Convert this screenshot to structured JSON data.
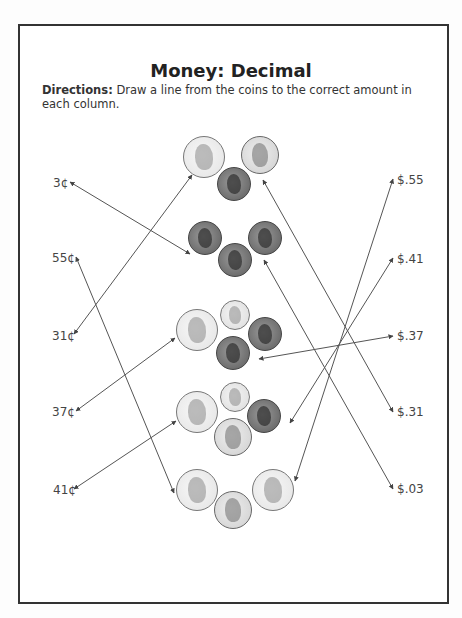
{
  "worksheet": {
    "title": "Money: Decimal",
    "directions_label": "Directions:",
    "directions_text": " Draw a line from the coins to the correct amount in each column."
  },
  "left_column": [
    {
      "label": "3¢",
      "x": 53,
      "y": 176
    },
    {
      "label": "55¢",
      "x": 52,
      "y": 251
    },
    {
      "label": "31¢",
      "x": 52,
      "y": 329
    },
    {
      "label": "37¢",
      "x": 52,
      "y": 405
    },
    {
      "label": "41¢",
      "x": 53,
      "y": 483
    }
  ],
  "right_column": [
    {
      "label": "$.55",
      "x": 397,
      "y": 173
    },
    {
      "label": "$.41",
      "x": 397,
      "y": 252
    },
    {
      "label": "$.37",
      "x": 397,
      "y": 329
    },
    {
      "label": "$.31",
      "x": 397,
      "y": 405
    },
    {
      "label": "$.03",
      "x": 397,
      "y": 482
    }
  ],
  "coin_groups": [
    {
      "name": "group-31-cents",
      "coins": [
        {
          "type": "quarter",
          "cx": 204,
          "cy": 157,
          "r": 21
        },
        {
          "type": "nickel",
          "cx": 260,
          "cy": 155,
          "r": 19
        },
        {
          "type": "penny",
          "cx": 234,
          "cy": 184,
          "r": 17
        }
      ]
    },
    {
      "name": "group-3-cents",
      "coins": [
        {
          "type": "penny",
          "cx": 205,
          "cy": 238,
          "r": 17
        },
        {
          "type": "penny",
          "cx": 265,
          "cy": 238,
          "r": 17
        },
        {
          "type": "penny",
          "cx": 235,
          "cy": 260,
          "r": 17
        }
      ]
    },
    {
      "name": "group-37-cents",
      "coins": [
        {
          "type": "quarter",
          "cx": 197,
          "cy": 330,
          "r": 21
        },
        {
          "type": "dime",
          "cx": 235,
          "cy": 315,
          "r": 15
        },
        {
          "type": "penny",
          "cx": 265,
          "cy": 334,
          "r": 17
        },
        {
          "type": "penny",
          "cx": 233,
          "cy": 353,
          "r": 17
        }
      ]
    },
    {
      "name": "group-41-cents",
      "coins": [
        {
          "type": "quarter",
          "cx": 197,
          "cy": 412,
          "r": 21
        },
        {
          "type": "dime",
          "cx": 235,
          "cy": 397,
          "r": 15
        },
        {
          "type": "penny",
          "cx": 264,
          "cy": 416,
          "r": 17
        },
        {
          "type": "nickel",
          "cx": 233,
          "cy": 437,
          "r": 19
        }
      ]
    },
    {
      "name": "group-55-cents",
      "coins": [
        {
          "type": "quarter",
          "cx": 197,
          "cy": 490,
          "r": 21
        },
        {
          "type": "quarter",
          "cx": 273,
          "cy": 490,
          "r": 21
        },
        {
          "type": "nickel",
          "cx": 233,
          "cy": 510,
          "r": 19
        }
      ]
    }
  ],
  "answer_lines": [
    {
      "from": "3¢",
      "x1": 70,
      "y1": 182,
      "x2": 190,
      "y2": 254
    },
    {
      "from": "31¢",
      "x1": 74,
      "y1": 334,
      "x2": 192,
      "y2": 175
    },
    {
      "from": "55¢",
      "x1": 76,
      "y1": 257,
      "x2": 174,
      "y2": 493
    },
    {
      "from": "37¢",
      "x1": 76,
      "y1": 411,
      "x2": 175,
      "y2": 338
    },
    {
      "from": "41¢",
      "x1": 74,
      "y1": 489,
      "x2": 176,
      "y2": 421
    },
    {
      "from": "$.55",
      "x1": 393,
      "y1": 179,
      "x2": 295,
      "y2": 481
    },
    {
      "from": "$.41",
      "x1": 393,
      "y1": 258,
      "x2": 290,
      "y2": 423
    },
    {
      "from": "$.37",
      "x1": 393,
      "y1": 336,
      "x2": 259,
      "y2": 359
    },
    {
      "from": "$.31",
      "x1": 393,
      "y1": 412,
      "x2": 263,
      "y2": 180
    },
    {
      "from": "$.03",
      "x1": 393,
      "y1": 489,
      "x2": 264,
      "y2": 260
    }
  ],
  "colors": {
    "line": "#555555",
    "border": "#333333"
  }
}
